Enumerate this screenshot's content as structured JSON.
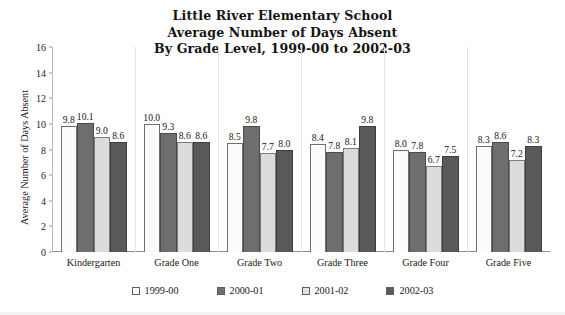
{
  "chart_data": {
    "type": "bar",
    "title": "Little River Elementary School Average Number of Days Absent By Grade Level, 1999-00 to 2002-03",
    "title_lines": [
      "Little River Elementary School",
      "Average Number of Days Absent",
      "By Grade Level, 1999-00 to 2002-03"
    ],
    "xlabel": "",
    "ylabel": "Average Number of Days Absent",
    "ylim": [
      0,
      16
    ],
    "ytick_step": 2,
    "yticks": [
      16,
      14,
      12,
      10,
      8,
      6,
      4,
      2,
      0
    ],
    "ytick_labels": [
      "16",
      "14",
      "12",
      "10",
      "8",
      "6",
      "4",
      "2",
      "0"
    ],
    "grid": "vertical-category-separators",
    "legend_position": "bottom",
    "data_labels": true,
    "categories": [
      "Kindergarten",
      "Grade One",
      "Grade Two",
      "Grade Three",
      "Grade Four",
      "Grade Five"
    ],
    "series": [
      {
        "name": "1999-00",
        "color": "#fbfbfb",
        "values": [
          9.8,
          10.0,
          8.5,
          8.4,
          8.0,
          8.3
        ],
        "labels": [
          "9.8",
          "10.0",
          "8.5",
          "8.4",
          "8.0",
          "8.3"
        ]
      },
      {
        "name": "2000-01",
        "color": "#6e6e6e",
        "values": [
          10.1,
          9.3,
          9.8,
          7.8,
          7.8,
          8.6
        ],
        "labels": [
          "10.1",
          "9.3",
          "9.8",
          "7.8",
          "7.8",
          "8.6"
        ]
      },
      {
        "name": "2001-02",
        "color": "#dcdcdc",
        "values": [
          9.0,
          8.6,
          7.7,
          8.1,
          6.7,
          7.2
        ],
        "labels": [
          "9.0",
          "8.6",
          "7.7",
          "8.1",
          "6.7",
          "7.2"
        ]
      },
      {
        "name": "2002-03",
        "color": "#595959",
        "values": [
          8.6,
          8.6,
          8.0,
          9.8,
          7.5,
          8.3
        ],
        "labels": [
          "8.6",
          "8.6",
          "8.0",
          "9.8",
          "7.5",
          "8.3"
        ]
      }
    ]
  }
}
